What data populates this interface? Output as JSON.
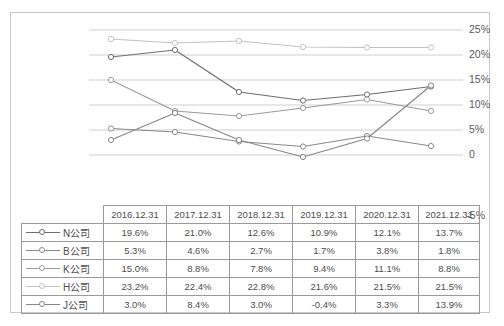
{
  "chart_data": {
    "type": "line",
    "title": "",
    "xlabel": "",
    "ylabel": "",
    "categories": [
      "2016.12.31",
      "2017.12.31",
      "2018.12.31",
      "2019.12.31",
      "2020.12.31",
      "2021.12.31"
    ],
    "ylim": [
      -5,
      25
    ],
    "ytick_labels": [
      "25%",
      "20%",
      "15%",
      "10%",
      "5%",
      "0",
      "-5%"
    ],
    "ytick_values": [
      25,
      20,
      15,
      10,
      5,
      0,
      -5
    ],
    "grid": true,
    "legend_position": "table-below",
    "series": [
      {
        "name": "N公司",
        "values": [
          19.6,
          21.0,
          12.6,
          10.9,
          12.1,
          13.7
        ],
        "color": "#6e6e6e",
        "marker": "circle"
      },
      {
        "name": "B公司",
        "values": [
          5.3,
          4.6,
          2.7,
          1.7,
          3.8,
          1.8
        ],
        "color": "#8a8a8a",
        "marker": "circle"
      },
      {
        "name": "K公司",
        "values": [
          15.0,
          8.8,
          7.8,
          9.4,
          11.1,
          8.8
        ],
        "color": "#9b9b9b",
        "marker": "circle"
      },
      {
        "name": "H公司",
        "values": [
          23.2,
          22.4,
          22.8,
          21.6,
          21.5,
          21.5
        ],
        "color": "#c2c2c2",
        "marker": "circle"
      },
      {
        "name": "J公司",
        "values": [
          3.0,
          8.4,
          3.0,
          -0.4,
          3.3,
          13.9
        ],
        "color": "#878787",
        "marker": "circle"
      }
    ]
  },
  "table": {
    "corner_label": "",
    "headers": [
      "2016.12.31",
      "2017.12.31",
      "2018.12.31",
      "2019.12.31",
      "2020.12.31",
      "2021.12.31"
    ],
    "rows": [
      {
        "label": "N公司",
        "cells": [
          "19.6%",
          "21.0%",
          "12.6%",
          "10.9%",
          "12.1%",
          "13.7%"
        ]
      },
      {
        "label": "B公司",
        "cells": [
          "5.3%",
          "4.6%",
          "2.7%",
          "1.7%",
          "3.8%",
          "1.8%"
        ]
      },
      {
        "label": "K公司",
        "cells": [
          "15.0%",
          "8.8%",
          "7.8%",
          "9.4%",
          "11.1%",
          "8.8%"
        ]
      },
      {
        "label": "H公司",
        "cells": [
          "23.2%",
          "22.4%",
          "22.8%",
          "21.6%",
          "21.5%",
          "21.5%"
        ]
      },
      {
        "label": "J公司",
        "cells": [
          "3.0%",
          "8.4%",
          "3.0%",
          "-0.4%",
          "3.3%",
          "13.9%"
        ]
      }
    ]
  },
  "colors": {
    "gridline": "#cfcfcf",
    "border": "#c9c9c9",
    "text": "#4d4d4d"
  }
}
